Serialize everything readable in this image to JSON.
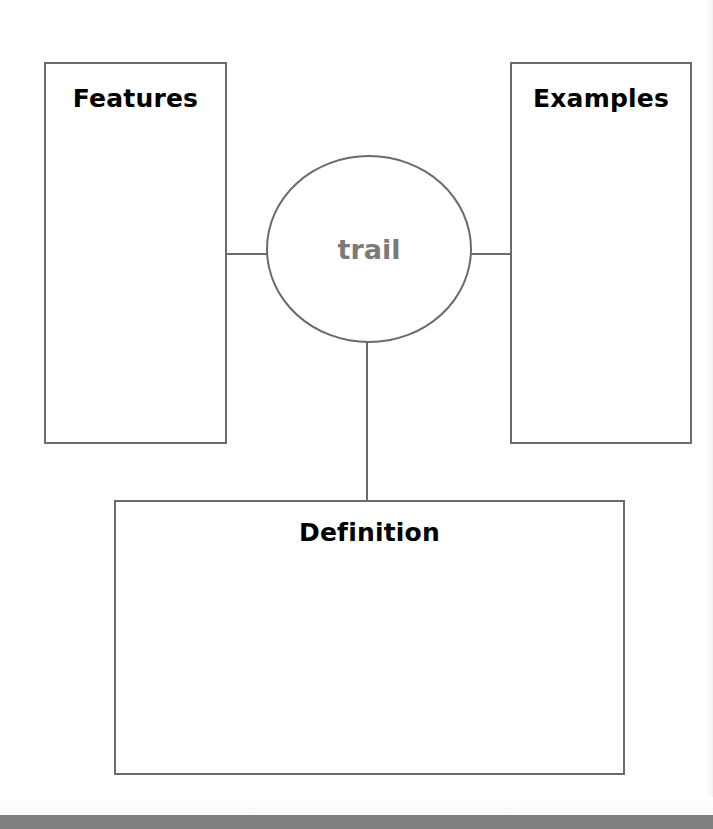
{
  "worksheet": {
    "title": "Concept Definition Map",
    "center_node": {
      "label": "trail",
      "shape": "ellipse",
      "text_color": "#7a7a7a"
    },
    "boxes": [
      {
        "id": "features",
        "label": "Features",
        "label_position": "top-center",
        "content": ""
      },
      {
        "id": "examples",
        "label": "Examples",
        "label_position": "top-center",
        "content": ""
      },
      {
        "id": "definition",
        "label": "Definition",
        "label_position": "top-center",
        "content": ""
      }
    ],
    "connectors": [
      {
        "id": "features-to-center",
        "orientation": "horizontal"
      },
      {
        "id": "examples-to-center",
        "orientation": "horizontal"
      },
      {
        "id": "center-to-definition",
        "orientation": "vertical"
      }
    ],
    "colors": {
      "page_background": "#ffffff",
      "stroke": "#6b6b6b",
      "label_text": "#000000",
      "node_text": "#7a7a7a",
      "bottom_bar": "#808080"
    }
  }
}
